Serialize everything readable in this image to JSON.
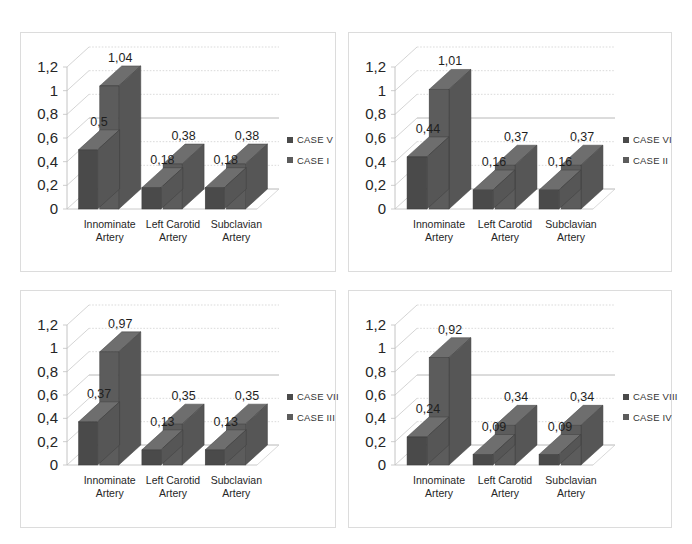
{
  "figure": {
    "background": "#ffffff",
    "panel_border_color": "#dcdcdc",
    "series1_color": "#4a4a4a",
    "series2_color": "#5c5c5c",
    "axis_text_color": "#262626"
  },
  "chart_data": [
    {
      "type": "bar",
      "panel": "top-left",
      "title": "",
      "xlabel": "",
      "ylabel": "",
      "categories": [
        "Innominate Artery",
        "Left Carotid Artery",
        "Subclavian Artery"
      ],
      "category_lines": [
        [
          "Innominate",
          "Artery"
        ],
        [
          "Left Carotid",
          "Artery"
        ],
        [
          "Subclavian",
          "Artery"
        ]
      ],
      "series": [
        {
          "name": "CASE V",
          "values": [
            0.5,
            0.18,
            0.18
          ],
          "labels": [
            "0,5",
            "0,18",
            "0,18"
          ],
          "color": "#4a4a4a"
        },
        {
          "name": "CASE I",
          "values": [
            1.04,
            0.38,
            0.38
          ],
          "labels": [
            "1,04",
            "0,38",
            "0,38"
          ],
          "color": "#5c5c5c"
        }
      ],
      "ylim": [
        0,
        1.2
      ],
      "yticks": [
        0,
        0.2,
        0.4,
        0.6,
        0.8,
        1.0,
        1.2
      ],
      "ytick_labels": [
        "0",
        "0,2",
        "0,4",
        "0,6",
        "0,8",
        "1",
        "1,2"
      ],
      "grid": true,
      "legend_position": "right",
      "three_d": true
    },
    {
      "type": "bar",
      "panel": "top-right",
      "title": "",
      "xlabel": "",
      "ylabel": "",
      "categories": [
        "Innominate Artery",
        "Left Carotid Artery",
        "Subclavian Artery"
      ],
      "category_lines": [
        [
          "Innominate",
          "Artery"
        ],
        [
          "Left Carotid",
          "Artery"
        ],
        [
          "Subclavian",
          "Artery"
        ]
      ],
      "series": [
        {
          "name": "CASE VI",
          "values": [
            0.44,
            0.16,
            0.16
          ],
          "labels": [
            "0,44",
            "0,16",
            "0,16"
          ],
          "color": "#4a4a4a"
        },
        {
          "name": "CASE II",
          "values": [
            1.01,
            0.37,
            0.37
          ],
          "labels": [
            "1,01",
            "0,37",
            "0,37"
          ],
          "color": "#5c5c5c"
        }
      ],
      "ylim": [
        0,
        1.2
      ],
      "yticks": [
        0,
        0.2,
        0.4,
        0.6,
        0.8,
        1.0,
        1.2
      ],
      "ytick_labels": [
        "0",
        "0,2",
        "0,4",
        "0,6",
        "0,8",
        "1",
        "1,2"
      ],
      "grid": true,
      "legend_position": "right",
      "three_d": true
    },
    {
      "type": "bar",
      "panel": "bottom-left",
      "title": "",
      "xlabel": "",
      "ylabel": "",
      "categories": [
        "Innominate Artery",
        "Left Carotid Artery",
        "Subclavian Artery"
      ],
      "category_lines": [
        [
          "Innominate",
          "Artery"
        ],
        [
          "Left Carotid",
          "Artery"
        ],
        [
          "Subclavian",
          "Artery"
        ]
      ],
      "series": [
        {
          "name": "CASE VII",
          "values": [
            0.37,
            0.13,
            0.13
          ],
          "labels": [
            "0,37",
            "0,13",
            "0,13"
          ],
          "color": "#4a4a4a"
        },
        {
          "name": "CASE III",
          "values": [
            0.97,
            0.35,
            0.35
          ],
          "labels": [
            "0,97",
            "0,35",
            "0,35"
          ],
          "color": "#5c5c5c"
        }
      ],
      "ylim": [
        0,
        1.2
      ],
      "yticks": [
        0,
        0.2,
        0.4,
        0.6,
        0.8,
        1.0,
        1.2
      ],
      "ytick_labels": [
        "0",
        "0,2",
        "0,4",
        "0,6",
        "0,8",
        "1",
        "1,2"
      ],
      "grid": true,
      "legend_position": "right",
      "three_d": true
    },
    {
      "type": "bar",
      "panel": "bottom-right",
      "title": "",
      "xlabel": "",
      "ylabel": "",
      "categories": [
        "Innominate Artery",
        "Left Carotid Artery",
        "Subclavian Artery"
      ],
      "category_lines": [
        [
          "Innominate",
          "Artery"
        ],
        [
          "Left Carotid",
          "Artery"
        ],
        [
          "Subclavian",
          "Artery"
        ]
      ],
      "series": [
        {
          "name": "CASE VIII",
          "values": [
            0.24,
            0.09,
            0.09
          ],
          "labels": [
            "0,24",
            "0,09",
            "0,09"
          ],
          "color": "#4a4a4a"
        },
        {
          "name": "CASE IV",
          "values": [
            0.92,
            0.34,
            0.34
          ],
          "labels": [
            "0,92",
            "0,34",
            "0,34"
          ],
          "color": "#5c5c5c"
        }
      ],
      "ylim": [
        0,
        1.2
      ],
      "yticks": [
        0,
        0.2,
        0.4,
        0.6,
        0.8,
        1.0,
        1.2
      ],
      "ytick_labels": [
        "0",
        "0,2",
        "0,4",
        "0,6",
        "0,8",
        "1",
        "1,2"
      ],
      "grid": true,
      "legend_position": "right",
      "three_d": true
    }
  ]
}
